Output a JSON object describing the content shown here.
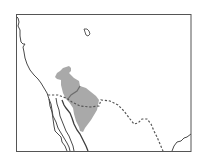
{
  "map": {
    "type": "species-range-map",
    "region": "Southwestern North America",
    "colors": {
      "background": "#ffffff",
      "frame": "#555555",
      "coastline": "#4a4a4a",
      "border_dashed": "#555555",
      "range_fill": "#a9a9a9"
    },
    "legend": [],
    "labels": []
  }
}
